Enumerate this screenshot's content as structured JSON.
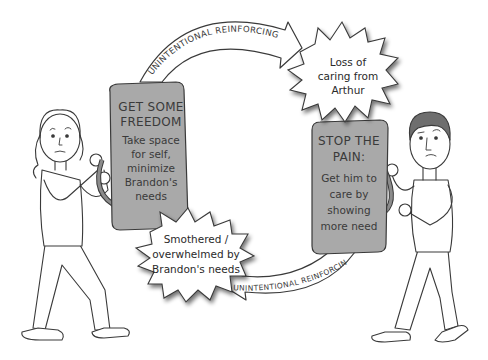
{
  "diagram": {
    "type": "reinforcing-cycle-cartoon",
    "left_person": {
      "shield": {
        "title_line1": "GET SOME",
        "title_line2": "FREEDOM",
        "body_lines": [
          "Take space",
          "for self,",
          "minimize",
          "Brandon's",
          "needs"
        ]
      }
    },
    "right_person": {
      "shield": {
        "title_line1": "STOP THE",
        "title_line2": "PAIN:",
        "body_lines": [
          "Get him to",
          "care by",
          "showing",
          "more need"
        ]
      }
    },
    "top_burst": {
      "lines": [
        "Loss of",
        "caring from",
        "Arthur"
      ]
    },
    "bottom_burst": {
      "lines": [
        "Smothered /",
        "overwhelmed by",
        "Brandon's needs"
      ]
    },
    "top_arrow": {
      "label": "UNINTENTIONAL REINFORCING"
    },
    "bottom_arrow": {
      "label": "UNINTENTIONAL REINFORCING"
    },
    "colors": {
      "shield_fill": "#a9a9a9",
      "outline": "#3a3a3a",
      "hair": "#6e6e6e",
      "background": "#ffffff"
    }
  }
}
